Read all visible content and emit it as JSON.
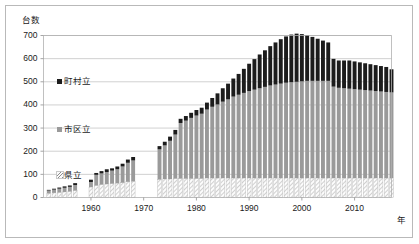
{
  "figure": {
    "border_color": "#b9b9b9",
    "background": "#ffffff"
  },
  "chart_data": {
    "type": "bar",
    "stacked": true,
    "title": "",
    "subtitle": "",
    "xlabel": "年",
    "ylabel": "台数",
    "ylim": [
      0,
      700
    ],
    "ytick_values": [
      0,
      100,
      200,
      300,
      400,
      500,
      600,
      700
    ],
    "ytick_labels": [
      "0",
      "100",
      "200",
      "300",
      "400",
      "500",
      "600",
      "700"
    ],
    "xlim": [
      1951,
      2017
    ],
    "xtick_values": [
      1960,
      1970,
      1980,
      1990,
      2000,
      2010
    ],
    "xtick_labels": [
      "1960",
      "1970",
      "1980",
      "1990",
      "2000",
      "2010"
    ],
    "grid": "horizontal",
    "legend_position": "inside-left",
    "legend": [
      {
        "name": "町村立",
        "marker": "filled-square",
        "color": "#1c1c1c"
      },
      {
        "name": "市区立",
        "marker": "filled-square",
        "color": "#9a9a9a"
      },
      {
        "name": "県立",
        "marker": "hatched-square",
        "color": "#fbfbfb"
      }
    ],
    "series": [
      {
        "name": "県立",
        "color": "#fbfbfb",
        "pattern": "diagonal-hatch",
        "values": [
          18,
          20,
          22,
          24,
          26,
          30,
          null,
          null,
          45,
          52,
          56,
          58,
          60,
          62,
          64,
          68,
          70,
          null,
          null,
          null,
          null,
          78,
          80,
          80,
          82,
          82,
          82,
          82,
          82,
          82,
          84,
          84,
          84,
          84,
          84,
          84,
          84,
          84,
          84,
          84,
          84,
          84,
          84,
          84,
          84,
          84,
          84,
          84,
          84,
          84,
          84,
          84,
          84,
          84,
          84,
          84,
          84,
          84,
          84,
          84,
          84,
          84,
          84,
          84,
          84,
          84
        ]
      },
      {
        "name": "市区立",
        "color": "#9a9a9a",
        "pattern": "solid",
        "values": [
          12,
          14,
          16,
          18,
          20,
          24,
          null,
          null,
          22,
          46,
          48,
          52,
          56,
          60,
          70,
          82,
          90,
          null,
          null,
          null,
          null,
          130,
          145,
          165,
          190,
          240,
          250,
          262,
          272,
          280,
          296,
          308,
          318,
          330,
          340,
          352,
          360,
          368,
          376,
          382,
          388,
          394,
          400,
          404,
          408,
          412,
          414,
          416,
          418,
          420,
          420,
          420,
          420,
          420,
          395,
          390,
          388,
          386,
          384,
          382,
          380,
          378,
          376,
          374,
          372,
          370
        ]
      },
      {
        "name": "町村立",
        "color": "#1c1c1c",
        "pattern": "solid",
        "values": [
          3,
          4,
          5,
          6,
          6,
          8,
          null,
          null,
          10,
          8,
          10,
          12,
          10,
          12,
          12,
          14,
          15,
          null,
          null,
          null,
          null,
          14,
          16,
          18,
          20,
          18,
          20,
          22,
          24,
          26,
          30,
          38,
          48,
          58,
          68,
          78,
          90,
          104,
          118,
          132,
          146,
          158,
          170,
          182,
          192,
          200,
          206,
          208,
          204,
          198,
          190,
          182,
          174,
          166,
          120,
          118,
          120,
          122,
          120,
          118,
          116,
          114,
          112,
          110,
          108,
          100
        ]
      }
    ],
    "x_years": [
      1952,
      1953,
      1954,
      1955,
      1956,
      1957,
      1958,
      1959,
      1960,
      1961,
      1962,
      1963,
      1964,
      1965,
      1966,
      1967,
      1968,
      1969,
      1970,
      1971,
      1972,
      1973,
      1974,
      1975,
      1976,
      1977,
      1978,
      1979,
      1980,
      1981,
      1982,
      1983,
      1984,
      1985,
      1986,
      1987,
      1988,
      1989,
      1990,
      1991,
      1992,
      1993,
      1994,
      1995,
      1996,
      1997,
      1998,
      1999,
      2000,
      2001,
      2002,
      2003,
      2004,
      2005,
      2006,
      2007,
      2008,
      2009,
      2010,
      2011,
      2012,
      2013,
      2014,
      2015,
      2016,
      2017
    ]
  }
}
